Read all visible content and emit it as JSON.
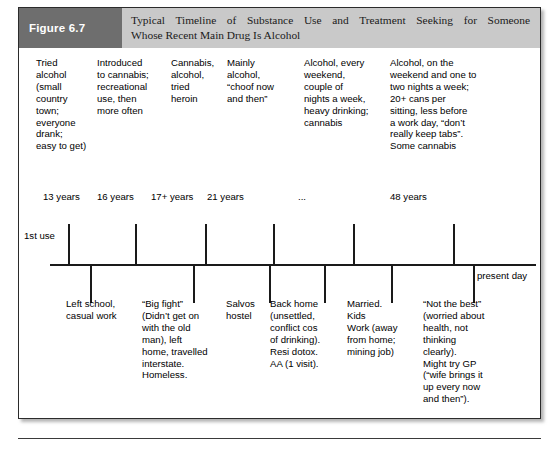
{
  "figure": {
    "label": "Figure 6.7",
    "title_line1": "Typical Timeline of Substance Use and Treatment Seeking for Someone",
    "title_line2": "Whose Recent Main Drug Is Alcohol"
  },
  "timeline": {
    "first_use_label": "1st use",
    "present_day_label": "present day"
  },
  "substance_use_columns": [
    {
      "text": "Tried\nalcohol\n(small\ncountry\ntown;\neveryone\ndrank;\neasy to get)"
    },
    {
      "text": "Introduced\nto cannabis;\nrecreational\nuse, then\nmore often"
    },
    {
      "text": "Cannabis,\nalcohol,\ntried\nheroin"
    },
    {
      "text": "Mainly\nalcohol,\n“choof now\nand then”"
    },
    {
      "text": "Alcohol, every\nweekend,\ncouple of\nnights a week,\nheavy drinking;\ncannabis"
    },
    {
      "text": "Alcohol, on the\nweekend and one to\ntwo nights a week;\n20+ cans per\nsitting, less before\na work day, “don’t\nreally keep tabs”.\nSome cannabis"
    }
  ],
  "age_markers": [
    {
      "label": "13 years"
    },
    {
      "label": "16 years"
    },
    {
      "label": "17+ years"
    },
    {
      "label": "21 years"
    },
    {
      "label": "..."
    },
    {
      "label": "48 years"
    }
  ],
  "life_event_columns": [
    {
      "text": "Left school,\ncasual work"
    },
    {
      "text": "“Big fight”\n(Didn’t get on\nwith the old\nman), left\nhome, travelled\ninterstate.\nHomeless."
    },
    {
      "text": "Salvos\nhostel"
    },
    {
      "text": "Back home\n(unsettled,\nconflict cos\nof drinking).\nResi dotox.\nAA (1 visit)."
    },
    {
      "text": "Married.\nKids\nWork (away\nfrom home;\nmining job)"
    },
    {
      "text": "“Not the best”\n(worried about\nhealth, not\nthinking\nclearly).\nMight try GP\n(“wife brings it\nup every now\nand then”)."
    }
  ],
  "colors": {
    "label_box": "#6e6e6e",
    "header_band": "#c9c9c9",
    "border": "#2b2b2b",
    "text": "#000000",
    "axis": "#1a1a1a"
  }
}
